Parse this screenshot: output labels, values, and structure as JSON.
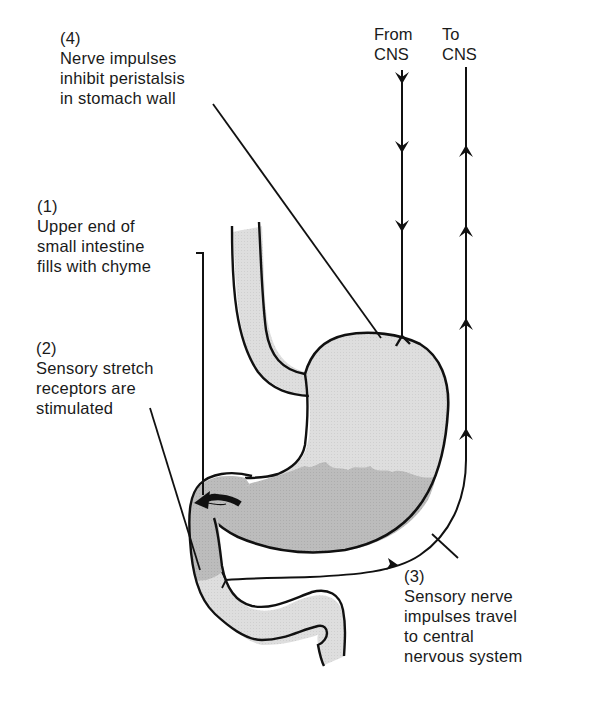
{
  "diagram": {
    "colors": {
      "outline": "#111111",
      "chyme_dark": "#b9b9b9",
      "tissue_light": "#dcdcdc",
      "background": "#ffffff"
    },
    "labels": {
      "step4": {
        "number": "(4)",
        "lines": [
          "Nerve impulses",
          "inhibit peristalsis",
          "in stomach wall"
        ]
      },
      "step1": {
        "number": "(1)",
        "lines": [
          "Upper end of",
          "small intestine",
          "fills with chyme"
        ]
      },
      "step2": {
        "number": "(2)",
        "lines": [
          "Sensory stretch",
          "receptors are",
          "stimulated"
        ]
      },
      "step3": {
        "number": "(3)",
        "lines": [
          "Sensory nerve",
          "impulses travel",
          "to central",
          "nervous system"
        ]
      }
    },
    "nerves": {
      "from_cns": {
        "line1": "From",
        "line2": "CNS",
        "direction": "down",
        "arrow_count": 3
      },
      "to_cns": {
        "line1": "To",
        "line2": "CNS",
        "direction": "up",
        "arrow_count": 4
      }
    },
    "structures": [
      "esophagus",
      "stomach",
      "pyloric sphincter",
      "duodenum (small intestine)"
    ]
  }
}
